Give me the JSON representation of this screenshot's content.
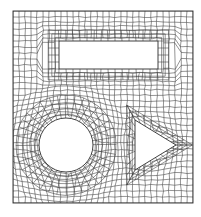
{
  "diagram": {
    "type": "quad-mesh",
    "colors": {
      "line": "#3a3a3a",
      "boundary": "#2a2a2a",
      "background": "#ffffff"
    },
    "domain": {
      "x": 13,
      "y": 11,
      "width": 180,
      "height": 192
    },
    "holes": [
      {
        "shape": "rectangle",
        "name": "top-rectangle",
        "x": 59,
        "y": 41,
        "width": 99,
        "height": 28
      },
      {
        "shape": "circle",
        "name": "left-circle",
        "cx": 66,
        "cy": 145,
        "r": 27
      },
      {
        "shape": "triangle",
        "name": "right-triangle",
        "points": [
          [
            135,
            120
          ],
          [
            135,
            170
          ],
          [
            176,
            145
          ]
        ]
      }
    ],
    "mesh": {
      "grid_cols": 30,
      "grid_rows": 32,
      "ring_layers": 4,
      "radial_spokes_circle": 36,
      "seed": 7
    }
  }
}
